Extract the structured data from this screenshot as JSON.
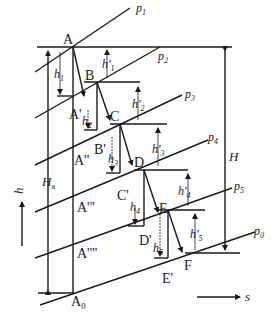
{
  "diagram": {
    "axes": {
      "vertical_label": "h",
      "horizontal_label": "s"
    },
    "isobars": [
      "p1",
      "p2",
      "p3",
      "p4",
      "p5",
      "p0"
    ],
    "points": {
      "A": "A",
      "B": "B",
      "C": "C",
      "D": "D",
      "E": "E",
      "F": "F",
      "A1": "A'",
      "A2": "A''",
      "A3": "A'''",
      "A4": "A''''",
      "A0": "A₀",
      "B1": "B'",
      "C1": "C'",
      "D1": "D'",
      "E1": "E'"
    },
    "heights": {
      "h1": "h",
      "h1_sub": "1",
      "h2": "h",
      "h2_sub": "2",
      "h3": "h",
      "h3_sub": "3",
      "h4": "h",
      "h4_sub": "4",
      "h5": "h",
      "h5_sub": "5",
      "hp1": "h'",
      "hp1_sub": "1",
      "hp2": "h'",
      "hp2_sub": "2",
      "hp3": "h'",
      "hp3_sub": "3",
      "hp4": "h'",
      "hp4_sub": "4",
      "hp5": "h'",
      "hp5_sub": "5",
      "Ha": "H",
      "Ha_sub": "a",
      "H": "H"
    },
    "labels": {
      "p1": "p",
      "p1_sub": "1",
      "p2": "p",
      "p2_sub": "2",
      "p3": "p",
      "p3_sub": "3",
      "p4": "p",
      "p4_sub": "4",
      "p5": "p",
      "p5_sub": "5",
      "p0": "p",
      "p0_sub": "0"
    }
  }
}
